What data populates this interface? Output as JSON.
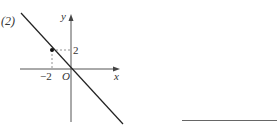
{
  "problem": {
    "label": "(2)"
  },
  "graph": {
    "axes": {
      "x_label": "x",
      "y_label": "y",
      "origin_label": "O"
    },
    "ticks": {
      "x_tick_label": "−2",
      "y_tick_label": "2"
    },
    "point": {
      "x": -2,
      "y": 2
    },
    "line": {
      "equation": "y = -x",
      "slope": -1,
      "intercept": 0
    },
    "colors": {
      "line": "#222222",
      "axis": "#555555",
      "dashed": "#777777"
    }
  },
  "answer": {
    "blank": ""
  }
}
